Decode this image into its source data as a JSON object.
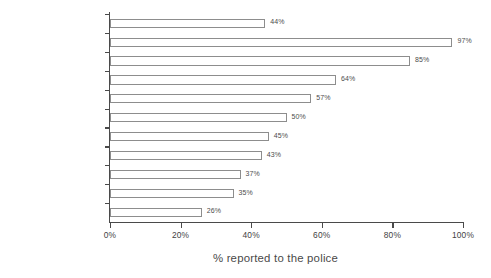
{
  "chart_data": {
    "type": "bar",
    "orientation": "horizontal",
    "title": "",
    "xlabel": "% reported to the police",
    "ylabel": "",
    "xlim": [
      0,
      100
    ],
    "grid": false,
    "legend": null,
    "categories": [
      "All comparable crime",
      "Theft of vehicle",
      "Burglary with loss",
      "Bicycle theft",
      "Robbery",
      "Burglary no loss",
      "Wounding",
      "Theft from vehicle",
      "Attempted vehicle theft",
      "Theft from person",
      "Vandalism"
    ],
    "values": [
      44,
      97,
      85,
      64,
      57,
      50,
      45,
      43,
      37,
      35,
      26
    ],
    "value_labels": [
      "44%",
      "97%",
      "85%",
      "64%",
      "57%",
      "50%",
      "45%",
      "43%",
      "37%",
      "35%",
      "26%"
    ],
    "xticks": [
      0,
      20,
      40,
      60,
      80,
      100
    ],
    "xtick_labels": [
      "0%",
      "20%",
      "40%",
      "60%",
      "80%",
      "100%"
    ],
    "colors": {
      "bar_fill": "#ffffff",
      "bar_border": "#8d8d8d",
      "axis": "#4a4a4a",
      "text": "#3f3f3f",
      "background": "#ffffff"
    }
  }
}
